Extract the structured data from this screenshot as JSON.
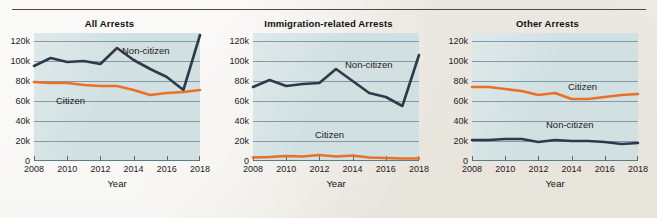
{
  "figure": {
    "background_color": "#f4f3ef",
    "panel_background_color": "#d2e0e2",
    "grid_color": "#6f8f9c",
    "rule_color": "#4a4a4a"
  },
  "series_colors": {
    "non_citizen": "#2e3a4a",
    "citizen": "#ea7026"
  },
  "axis": {
    "ylabel": "",
    "xlabel": "Year",
    "ytick_labels": [
      "0",
      "20k",
      "40k",
      "60k",
      "80k",
      "100k",
      "120k"
    ],
    "ytick_values": [
      0,
      20000,
      40000,
      60000,
      80000,
      100000,
      120000
    ],
    "xtick_labels": [
      "2008",
      "2010",
      "2012",
      "2014",
      "2016",
      "2018"
    ],
    "xtick_values": [
      2008,
      2010,
      2012,
      2014,
      2016,
      2018
    ],
    "ylim": [
      0,
      128000
    ],
    "xlim": [
      2008,
      2018
    ]
  },
  "chart_data": [
    {
      "type": "line",
      "title": "All Arrests",
      "xlabel": "Year",
      "ylabel": "",
      "xlim": [
        2008,
        2018
      ],
      "ylim": [
        0,
        128000
      ],
      "grid": true,
      "legend": "inline-annotations",
      "x": [
        2008,
        2009,
        2010,
        2011,
        2012,
        2013,
        2014,
        2015,
        2016,
        2017,
        2018
      ],
      "series": [
        {
          "name": "Non-citizen",
          "color": "#2e3a4a",
          "label_position": "upper-right",
          "values": [
            95000,
            103000,
            99000,
            100000,
            97000,
            113000,
            101000,
            92000,
            84000,
            71000,
            126000
          ]
        },
        {
          "name": "Citizen",
          "color": "#ea7026",
          "label_position": "lower-left",
          "values": [
            79000,
            78000,
            78000,
            76000,
            75000,
            75000,
            71000,
            66000,
            68000,
            69000,
            71000
          ]
        }
      ]
    },
    {
      "type": "line",
      "title": "Immigration-related Arrests",
      "xlabel": "Year",
      "ylabel": "",
      "xlim": [
        2008,
        2018
      ],
      "ylim": [
        0,
        128000
      ],
      "grid": true,
      "legend": "inline-annotations",
      "x": [
        2008,
        2009,
        2010,
        2011,
        2012,
        2013,
        2014,
        2015,
        2016,
        2017,
        2018
      ],
      "series": [
        {
          "name": "Non-citizen",
          "color": "#2e3a4a",
          "label_position": "upper-right",
          "values": [
            74000,
            81000,
            75000,
            77000,
            78000,
            92000,
            80000,
            68000,
            64000,
            55000,
            106000
          ]
        },
        {
          "name": "Citizen",
          "color": "#ea7026",
          "label_position": "lower-center",
          "values": [
            3500,
            4000,
            5000,
            4500,
            6000,
            4500,
            5500,
            3500,
            3000,
            2500,
            2500
          ]
        }
      ]
    },
    {
      "type": "line",
      "title": "Other Arrests",
      "xlabel": "Year",
      "ylabel": "",
      "xlim": [
        2008,
        2018
      ],
      "ylim": [
        0,
        128000
      ],
      "grid": true,
      "legend": "inline-annotations",
      "x": [
        2008,
        2009,
        2010,
        2011,
        2012,
        2013,
        2014,
        2015,
        2016,
        2017,
        2018
      ],
      "series": [
        {
          "name": "Citizen",
          "color": "#ea7026",
          "label_position": "upper-right",
          "values": [
            74000,
            74000,
            72000,
            70000,
            66000,
            68000,
            62000,
            62000,
            64000,
            66000,
            67000
          ]
        },
        {
          "name": "Non-citizen",
          "color": "#2e3a4a",
          "label_position": "lower-right",
          "values": [
            21000,
            21000,
            22000,
            22000,
            19000,
            21000,
            20000,
            20000,
            19000,
            17000,
            18000
          ]
        }
      ]
    }
  ]
}
